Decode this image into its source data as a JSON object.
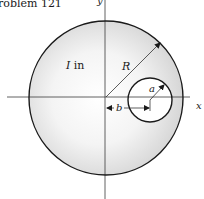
{
  "caption": "roblem 121",
  "axes": {
    "x_label": "x",
    "y_label": "y"
  },
  "labels": {
    "moment_symbol": "I",
    "moment_suffix": " in",
    "big_radius": "R",
    "small_radius": "a",
    "offset": "b"
  },
  "geometry": {
    "big_circle": {
      "cx": 106,
      "cy": 98,
      "r": 77
    },
    "small_circle": {
      "cx": 150,
      "cy": 100,
      "r": 22
    }
  },
  "colors": {
    "stroke": "#1a1a1a",
    "axis": "#333333",
    "fill_edge": "#d9d9d9",
    "fill_center": "#ffffff"
  }
}
